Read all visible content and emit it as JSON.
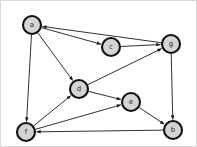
{
  "figure": {
    "type": "directed-graph",
    "width": 197,
    "height": 147,
    "background_color": "#ffffff",
    "border_color": "#d8d8d8"
  },
  "style": {
    "node_fill": "#d4d4d4",
    "node_stroke": "#111111",
    "node_radius": 9,
    "edge_color": "#1a1a1a",
    "label_color": "#2b2b2b"
  },
  "nodes": [
    {
      "id": "a",
      "label": "a",
      "x": 31,
      "y": 24
    },
    {
      "id": "c",
      "label": "c",
      "x": 110,
      "y": 46
    },
    {
      "id": "g",
      "label": "g",
      "x": 170,
      "y": 43
    },
    {
      "id": "d",
      "label": "d",
      "x": 78,
      "y": 88
    },
    {
      "id": "e",
      "label": "e",
      "x": 130,
      "y": 101
    },
    {
      "id": "f",
      "label": "f",
      "x": 25,
      "y": 131
    },
    {
      "id": "b",
      "label": "b",
      "x": 172,
      "y": 129
    }
  ],
  "edges": [
    {
      "id": "e1",
      "from": "a",
      "to": "c",
      "directed": true
    },
    {
      "id": "e2",
      "from": "g",
      "to": "a",
      "directed": true
    },
    {
      "id": "e3",
      "from": "c",
      "to": "g",
      "directed": true
    },
    {
      "id": "e4",
      "from": "a",
      "to": "d",
      "directed": true
    },
    {
      "id": "e5",
      "from": "a",
      "to": "f",
      "directed": true
    },
    {
      "id": "e6",
      "from": "d",
      "to": "g",
      "directed": true
    },
    {
      "id": "e7",
      "from": "f",
      "to": "d",
      "directed": true
    },
    {
      "id": "e8",
      "from": "d",
      "to": "e",
      "directed": true
    },
    {
      "id": "e9",
      "from": "f",
      "to": "e",
      "directed": true
    },
    {
      "id": "e10",
      "from": "g",
      "to": "b",
      "directed": true
    },
    {
      "id": "e11",
      "from": "e",
      "to": "b",
      "directed": true
    },
    {
      "id": "e12",
      "from": "b",
      "to": "f",
      "directed": true
    }
  ]
}
